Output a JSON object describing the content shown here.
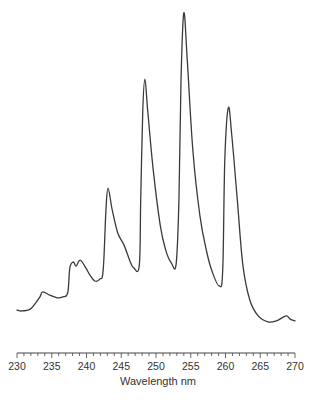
{
  "chart_data": {
    "type": "line",
    "title": "",
    "xlabel": "Wavelength nm",
    "ylabel": "",
    "xlim": [
      230,
      270
    ],
    "ylim": [
      0,
      100
    ],
    "x_ticks": {
      "major": [
        230,
        235,
        240,
        245,
        250,
        255,
        260,
        265,
        270
      ],
      "major_labels": [
        "230",
        "235",
        "240",
        "245",
        "250",
        "255",
        "260",
        "265",
        "270"
      ],
      "minor_step": 1
    },
    "y_axis_visible": false,
    "grid": false,
    "legend": "none",
    "series": [
      {
        "name": "spectrum",
        "color": "#3a3a3a",
        "x": [
          230.0,
          230.7,
          231.9,
          232.7,
          233.3,
          233.7,
          234.7,
          235.8,
          236.6,
          237.3,
          237.6,
          238.1,
          238.5,
          239.1,
          239.9,
          240.5,
          241.2,
          241.9,
          242.4,
          242.8,
          243.1,
          243.7,
          244.5,
          245.4,
          246.3,
          246.8,
          247.6,
          247.8,
          248.1,
          248.4,
          248.8,
          249.6,
          250.6,
          251.4,
          252.2,
          252.9,
          253.3,
          253.6,
          254.0,
          254.5,
          255.3,
          256.3,
          257.3,
          258.1,
          259.1,
          259.6,
          259.9,
          260.4,
          260.9,
          261.7,
          262.5,
          263.5,
          264.7,
          266.1,
          267.3,
          268.7,
          269.3,
          270.0
        ],
        "y": [
          4.8,
          4.5,
          5.1,
          7.1,
          9.0,
          10.6,
          9.6,
          8.7,
          9.0,
          10.3,
          18.3,
          20.2,
          18.9,
          20.8,
          18.3,
          16.0,
          14.1,
          14.7,
          17.6,
          36.9,
          43.9,
          36.9,
          29.5,
          25.6,
          20.2,
          18.3,
          19.2,
          40.1,
          68.9,
          78.8,
          68.9,
          49.7,
          32.1,
          24.0,
          19.9,
          19.6,
          40.1,
          78.5,
          100.0,
          84.9,
          56.1,
          35.3,
          23.4,
          17.0,
          12.5,
          17.6,
          52.9,
          69.6,
          60.9,
          40.1,
          19.2,
          8.0,
          2.9,
          1.0,
          1.3,
          2.9,
          1.9,
          1.3
        ]
      }
    ],
    "peaks": [
      {
        "wavelength": 243.1,
        "relative_intensity": 43.9
      },
      {
        "wavelength": 248.4,
        "relative_intensity": 78.8
      },
      {
        "wavelength": 254.0,
        "relative_intensity": 100.0
      },
      {
        "wavelength": 260.4,
        "relative_intensity": 69.6
      }
    ]
  }
}
